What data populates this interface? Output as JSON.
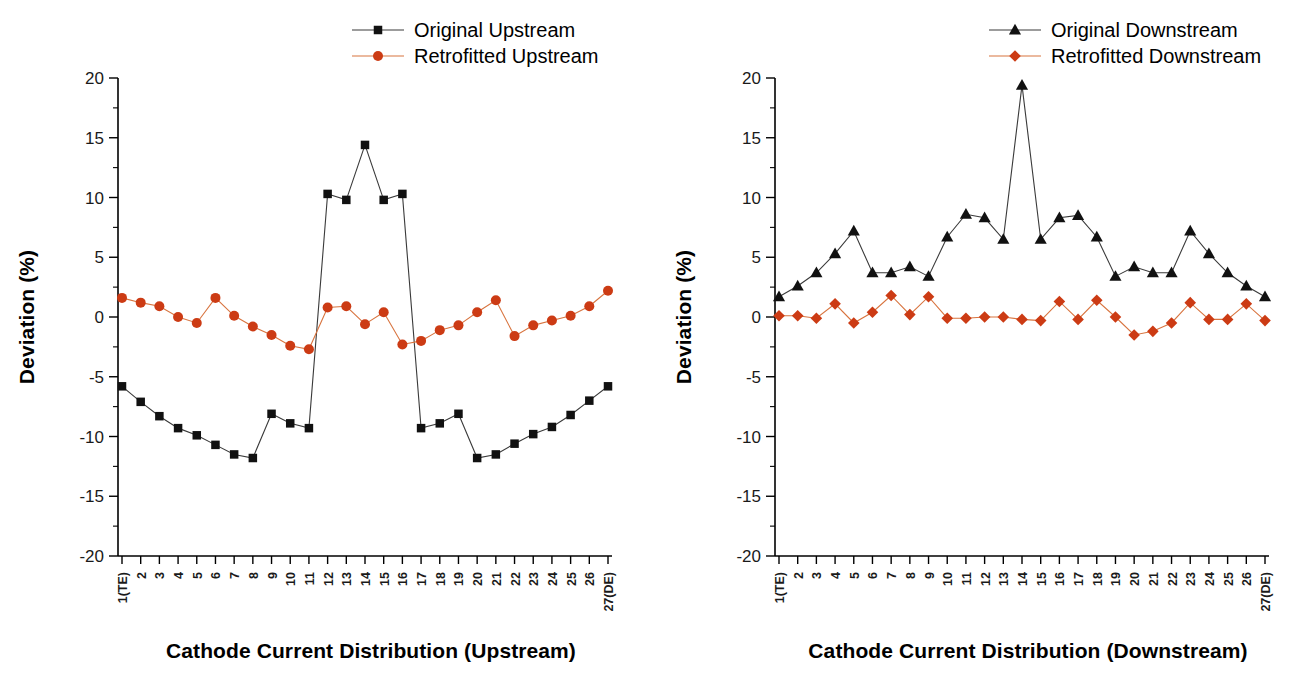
{
  "chart_data": [
    {
      "type": "line",
      "panel": "left",
      "title": "",
      "xlabel": "Cathode Current Distribution (Upstream)",
      "ylabel": "Deviation (%)",
      "ylim": [
        -20,
        20
      ],
      "yticks": [
        20,
        15,
        10,
        5,
        0,
        -5,
        -10,
        -15,
        -20
      ],
      "ytick_labels": [
        "20",
        "15",
        "10",
        "5",
        "0",
        "-5",
        "-10",
        "-15",
        "-20"
      ],
      "grid": false,
      "legend_position": "top-right",
      "categories": [
        "1(TE)",
        "2",
        "3",
        "4",
        "5",
        "6",
        "7",
        "8",
        "9",
        "10",
        "11",
        "12",
        "13",
        "14",
        "15",
        "16",
        "17",
        "18",
        "19",
        "20",
        "21",
        "22",
        "23",
        "24",
        "25",
        "26",
        "27(DE)"
      ],
      "series": [
        {
          "name": "Original Upstream",
          "marker": "square",
          "color": "#111111",
          "values": [
            -5.8,
            -7.1,
            -8.3,
            -9.3,
            -9.9,
            -10.7,
            -11.5,
            -11.8,
            -8.1,
            -8.9,
            -9.3,
            10.3,
            9.8,
            14.4,
            9.8,
            10.3,
            -9.3,
            -8.9,
            -8.1,
            -11.8,
            -11.5,
            -10.6,
            -9.8,
            -9.2,
            -8.2,
            -7.0,
            -5.8
          ]
        },
        {
          "name": "Retrofitted Upstream",
          "marker": "circle",
          "color": "#CC3B14",
          "values": [
            1.6,
            1.2,
            0.9,
            0.0,
            -0.5,
            1.6,
            0.1,
            -0.8,
            -1.5,
            -2.4,
            -2.7,
            0.8,
            0.9,
            -0.6,
            0.4,
            -2.3,
            -2.0,
            -1.1,
            -0.7,
            0.4,
            1.4,
            -1.6,
            -0.7,
            -0.3,
            0.1,
            0.9,
            2.2
          ]
        }
      ]
    },
    {
      "type": "line",
      "panel": "right",
      "title": "",
      "xlabel": "Cathode Current Distribution (Downstream)",
      "ylabel": "Deviation (%)",
      "ylim": [
        -20,
        20
      ],
      "yticks": [
        20,
        15,
        10,
        5,
        0,
        -5,
        -10,
        -15,
        -20
      ],
      "ytick_labels": [
        "20",
        "15",
        "10",
        "5",
        "0",
        "-5",
        "-10",
        "-15",
        "-20"
      ],
      "grid": false,
      "legend_position": "top-right",
      "categories": [
        "1(TE)",
        "2",
        "3",
        "4",
        "5",
        "6",
        "7",
        "8",
        "9",
        "10",
        "11",
        "12",
        "13",
        "14",
        "15",
        "16",
        "17",
        "18",
        "19",
        "20",
        "21",
        "22",
        "23",
        "24",
        "25",
        "26",
        "27(DE)"
      ],
      "series": [
        {
          "name": "Original Downstream",
          "marker": "triangle",
          "color": "#111111",
          "values": [
            1.7,
            2.6,
            3.7,
            5.3,
            7.2,
            3.7,
            3.7,
            4.2,
            3.4,
            6.7,
            8.6,
            8.3,
            6.5,
            19.4,
            6.5,
            8.3,
            8.5,
            6.7,
            3.4,
            4.2,
            3.7,
            3.7,
            7.2,
            5.3,
            3.7,
            2.6,
            1.7
          ]
        },
        {
          "name": "Retrofitted Downstream",
          "marker": "diamond",
          "color": "#CC3B14",
          "values": [
            0.1,
            0.1,
            -0.1,
            1.1,
            -0.5,
            0.4,
            1.8,
            0.2,
            1.7,
            -0.1,
            -0.1,
            0.0,
            0.0,
            -0.2,
            -0.3,
            1.3,
            -0.2,
            1.4,
            0.0,
            -1.5,
            -1.2,
            -0.5,
            1.2,
            -0.2,
            -0.2,
            1.1,
            -0.3
          ]
        }
      ]
    }
  ],
  "panels": {
    "left": {
      "ylabel": "Deviation (%)",
      "xlabel": "Cathode Current Distribution (Upstream)",
      "legend": [
        {
          "label": "Original Upstream",
          "marker": "square-marker-icon",
          "color": "#111111"
        },
        {
          "label": "Retrofitted Upstream",
          "marker": "circle-marker-icon",
          "color": "#CC3B14"
        }
      ]
    },
    "right": {
      "ylabel": "Deviation (%)",
      "xlabel": "Cathode Current Distribution (Downstream)",
      "legend": [
        {
          "label": "Original Downstream",
          "marker": "triangle-marker-icon",
          "color": "#111111"
        },
        {
          "label": "Retrofitted Downstream",
          "marker": "diamond-marker-icon",
          "color": "#CC3B14"
        }
      ]
    }
  },
  "colors": {
    "black_series": "#111111",
    "red_series": "#CC3B14",
    "black_line": "#3a3a3a",
    "red_line": "#d8743f",
    "axis": "#000000"
  }
}
